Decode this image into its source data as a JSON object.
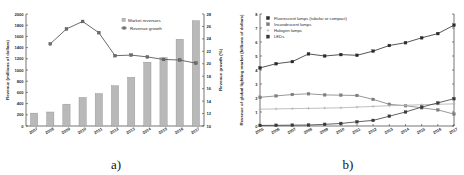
{
  "figure": {
    "panel_a_caption": "a)",
    "panel_b_caption": "b)"
  },
  "chart_data": [
    {
      "id": "panel_a",
      "type": "bar",
      "title": "",
      "xlabel": "",
      "ylabel": "Revenue (millions of dollars)",
      "y2label": "Revenue growth (%)",
      "categories": [
        "2007",
        "2008",
        "2009",
        "2010",
        "2011",
        "2012",
        "2013",
        "2014",
        "2015",
        "2016",
        "2017"
      ],
      "ylim": [
        0,
        2000
      ],
      "yticks": [
        0,
        200,
        400,
        600,
        800,
        1000,
        1200,
        1400,
        1600,
        1800,
        2000
      ],
      "y2lim": [
        10,
        28
      ],
      "y2ticks": [
        10,
        12,
        14,
        16,
        18,
        20,
        22,
        24,
        26,
        28
      ],
      "grid": false,
      "legend_position": "top-center",
      "series": [
        {
          "name": "Market revenues",
          "kind": "bar",
          "axis": "left",
          "color": "#b9b9b9",
          "marker": "square-filled",
          "values": [
            230,
            250,
            390,
            510,
            580,
            720,
            870,
            1140,
            1220,
            1550,
            1880
          ]
        },
        {
          "name": "Revenue growth",
          "kind": "line",
          "axis": "right",
          "color": "#6e6e6e",
          "marker": "square-filled",
          "values": [
            null,
            23.2,
            25.6,
            26.8,
            25.0,
            21.3,
            21.4,
            21.1,
            20.7,
            20.6,
            20.1
          ]
        }
      ]
    },
    {
      "id": "panel_b",
      "type": "line",
      "title": "",
      "xlabel": "",
      "ylabel": "Revenue of global lighting market (billions of dollars)",
      "categories": [
        "2005",
        "2006",
        "2007",
        "2008",
        "2009",
        "2010",
        "2011",
        "2012",
        "2013",
        "2014",
        "2015",
        "2016",
        "2017"
      ],
      "ylim": [
        0,
        8
      ],
      "yticks": [
        0,
        1,
        2,
        3,
        4,
        5,
        6,
        7,
        8
      ],
      "grid": false,
      "legend_position": "top-left",
      "series": [
        {
          "name": "Fluorescent lamps (tubular or compact)",
          "color": "#2a2a2a",
          "marker": "square-filled",
          "values": [
            4.15,
            4.45,
            4.6,
            5.15,
            5.0,
            5.1,
            5.05,
            5.35,
            5.75,
            5.95,
            6.3,
            6.6,
            7.2
          ]
        },
        {
          "name": "Incandescent lamps",
          "color": "#7d7d7d",
          "marker": "square-filled",
          "values": [
            2.05,
            2.15,
            2.25,
            2.3,
            2.22,
            2.2,
            2.18,
            1.9,
            1.55,
            1.45,
            1.3,
            1.15,
            0.85
          ]
        },
        {
          "name": "Halogen lamps",
          "color": "#b0b0b0",
          "marker": "plus",
          "values": [
            1.2,
            1.22,
            1.24,
            1.26,
            1.28,
            1.3,
            1.35,
            1.4,
            1.45,
            1.48,
            1.52,
            1.55,
            1.58
          ]
        },
        {
          "name": "LEDs",
          "color": "#3a3a3a",
          "marker": "square-filled",
          "values": [
            0.04,
            0.05,
            0.06,
            0.07,
            0.12,
            0.18,
            0.3,
            0.4,
            0.7,
            1.0,
            1.35,
            1.65,
            1.95
          ]
        }
      ]
    }
  ]
}
